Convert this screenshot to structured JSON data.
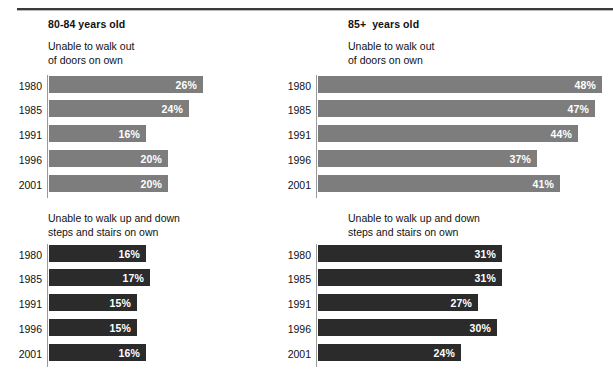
{
  "figure": {
    "background": "#ffffff",
    "rule_color": "#3a3a3a",
    "gray_bar_color": "#7d7d7d",
    "dark_bar_color": "#2b2b2b",
    "value_label_color": "#ffffff"
  },
  "panels": [
    {
      "id": "top-left",
      "group_title": "80-84 years old",
      "subtitle": "Unable to walk out\nof doors on own",
      "bar_color": "#7d7d7d",
      "years": [
        "1980",
        "1985",
        "1991",
        "1996",
        "2001"
      ],
      "values": [
        "26%",
        "24%",
        "16%",
        "20%",
        "20%"
      ],
      "bar_px": [
        154,
        140,
        97,
        119,
        119
      ]
    },
    {
      "id": "top-right",
      "group_title": "85+  years old",
      "subtitle": "Unable to walk out\nof doors on own",
      "bar_color": "#7d7d7d",
      "years": [
        "1980",
        "1985",
        "1991",
        "1996",
        "2001"
      ],
      "values": [
        "48%",
        "47%",
        "44%",
        "37%",
        "41%"
      ],
      "bar_px": [
        284,
        277,
        260,
        219,
        242
      ]
    },
    {
      "id": "bottom-left",
      "group_title": "",
      "subtitle": "Unable to walk up and down\nsteps and stairs on own",
      "bar_color": "#2b2b2b",
      "years": [
        "1980",
        "1985",
        "1991",
        "1996",
        "2001"
      ],
      "values": [
        "16%",
        "17%",
        "15%",
        "15%",
        "16%"
      ],
      "bar_px": [
        97,
        101,
        88,
        88,
        97
      ]
    },
    {
      "id": "bottom-right",
      "group_title": "",
      "subtitle": "Unable to walk up and down\nsteps and stairs on own",
      "bar_color": "#2b2b2b",
      "years": [
        "1980",
        "1985",
        "1991",
        "1996",
        "2001"
      ],
      "values": [
        "31%",
        "31%",
        "27%",
        "30%",
        "24%"
      ],
      "bar_px": [
        184,
        184,
        160,
        179,
        143
      ]
    }
  ],
  "chart_data": [
    {
      "type": "bar",
      "orientation": "horizontal",
      "title": "80-84 years old",
      "subtitle": "Unable to walk out of doors on own",
      "categories": [
        "1980",
        "1985",
        "1991",
        "1996",
        "2001"
      ],
      "values": [
        26,
        24,
        16,
        20,
        20
      ],
      "value_labels": [
        "26%",
        "24%",
        "16%",
        "20%",
        "20%"
      ],
      "xlabel": "",
      "ylabel": "",
      "unit": "percent",
      "grid": false,
      "legend": "none",
      "series_color": "#7d7d7d"
    },
    {
      "type": "bar",
      "orientation": "horizontal",
      "title": "85+  years old",
      "subtitle": "Unable to walk out of doors on own",
      "categories": [
        "1980",
        "1985",
        "1991",
        "1996",
        "2001"
      ],
      "values": [
        48,
        47,
        44,
        37,
        41
      ],
      "value_labels": [
        "48%",
        "47%",
        "44%",
        "37%",
        "41%"
      ],
      "xlabel": "",
      "ylabel": "",
      "unit": "percent",
      "grid": false,
      "legend": "none",
      "series_color": "#7d7d7d"
    },
    {
      "type": "bar",
      "orientation": "horizontal",
      "title": "80-84 years old",
      "subtitle": "Unable to walk up and down steps and stairs on own",
      "categories": [
        "1980",
        "1985",
        "1991",
        "1996",
        "2001"
      ],
      "values": [
        16,
        17,
        15,
        15,
        16
      ],
      "value_labels": [
        "16%",
        "17%",
        "15%",
        "15%",
        "16%"
      ],
      "xlabel": "",
      "ylabel": "",
      "unit": "percent",
      "grid": false,
      "legend": "none",
      "series_color": "#2b2b2b"
    },
    {
      "type": "bar",
      "orientation": "horizontal",
      "title": "85+  years old",
      "subtitle": "Unable to walk up and down steps and stairs on own",
      "categories": [
        "1980",
        "1985",
        "1991",
        "1996",
        "2001"
      ],
      "values": [
        31,
        31,
        27,
        30,
        24
      ],
      "value_labels": [
        "31%",
        "31%",
        "27%",
        "30%",
        "24%"
      ],
      "xlabel": "",
      "ylabel": "",
      "unit": "percent",
      "grid": false,
      "legend": "none",
      "series_color": "#2b2b2b"
    }
  ]
}
